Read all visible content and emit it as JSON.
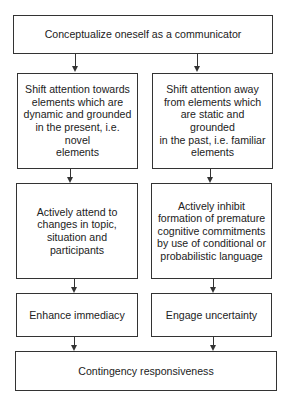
{
  "diagram": {
    "type": "flowchart",
    "top": {
      "label": "Conceptualize oneself as a communicator"
    },
    "left_column": [
      {
        "label": "Shift attention towards\nelements which are\ndynamic and grounded\nin the present, i.e. novel\nelements"
      },
      {
        "label": "Actively attend to\nchanges in topic,\nsituation and\nparticipants"
      },
      {
        "label": "Enhance immediacy"
      }
    ],
    "right_column": [
      {
        "label": "Shift attention away\nfrom elements which\nare static and grounded\nin the past, i.e. familiar\nelements"
      },
      {
        "label": "Actively inhibit\nformation of premature\ncognitive commitments\nby use of conditional or\nprobabilistic language"
      },
      {
        "label": "Engage uncertainty"
      }
    ],
    "bottom": {
      "label": "Contingency responsiveness"
    },
    "colors": {
      "stroke": "#333333",
      "background": "#ffffff",
      "text": "#222222"
    }
  }
}
